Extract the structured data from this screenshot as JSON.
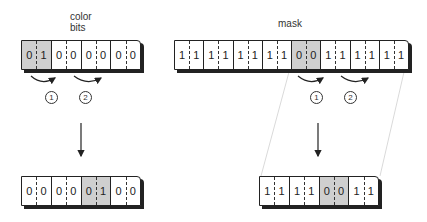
{
  "labels": {
    "color_bits": "color",
    "color_bits_2": "bits",
    "mask": "mask"
  },
  "left_top": {
    "pairs": [
      [
        "0",
        "1"
      ],
      [
        "0",
        "0"
      ],
      [
        "0",
        "0"
      ],
      [
        "0",
        "0"
      ]
    ],
    "highlight": 0
  },
  "right_top": {
    "pairs": [
      [
        "1",
        "1"
      ],
      [
        "1",
        "1"
      ],
      [
        "1",
        "1"
      ],
      [
        "1",
        "1"
      ],
      [
        "0",
        "0"
      ],
      [
        "1",
        "1"
      ],
      [
        "1",
        "1"
      ],
      [
        "1",
        "1"
      ]
    ],
    "highlight": 4
  },
  "left_bottom": {
    "pairs": [
      [
        "0",
        "0"
      ],
      [
        "0",
        "0"
      ],
      [
        "0",
        "1"
      ],
      [
        "0",
        "0"
      ]
    ],
    "highlight": 2
  },
  "right_bottom": {
    "pairs": [
      [
        "1",
        "1"
      ],
      [
        "1",
        "1"
      ],
      [
        "0",
        "0"
      ],
      [
        "1",
        "1"
      ]
    ],
    "highlight": 2
  },
  "steps": {
    "one": "1",
    "two": "2"
  }
}
